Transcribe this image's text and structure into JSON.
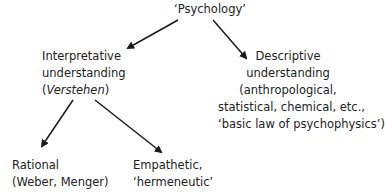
{
  "diagram": {
    "type": "tree",
    "root": {
      "label": "‘Psychology’"
    },
    "interpretative": {
      "line1": "Interpretative",
      "line2": "understanding",
      "line3_open": "(",
      "line3_italic": "Verstehen",
      "line3_close": ")"
    },
    "descriptive": {
      "line1": "Descriptive",
      "line2": "understanding",
      "line3": "(anthropological,",
      "line4": "statistical, chemical, etc.,",
      "line5": "‘basic law of psychophysics’)"
    },
    "rational": {
      "line1": "Rational",
      "line2": "(Weber, Menger)"
    },
    "empathetic": {
      "line1": "Empathetic,",
      "line2": "‘hermeneutic’"
    },
    "edges": [
      {
        "from": "Psychology",
        "to": "Interpretative understanding"
      },
      {
        "from": "Psychology",
        "to": "Descriptive understanding"
      },
      {
        "from": "Interpretative understanding",
        "to": "Rational"
      },
      {
        "from": "Interpretative understanding",
        "to": "Empathetic"
      }
    ],
    "colors": {
      "text": "#222222",
      "arrow": "#1a1a1a",
      "background": "#ffffff"
    }
  }
}
